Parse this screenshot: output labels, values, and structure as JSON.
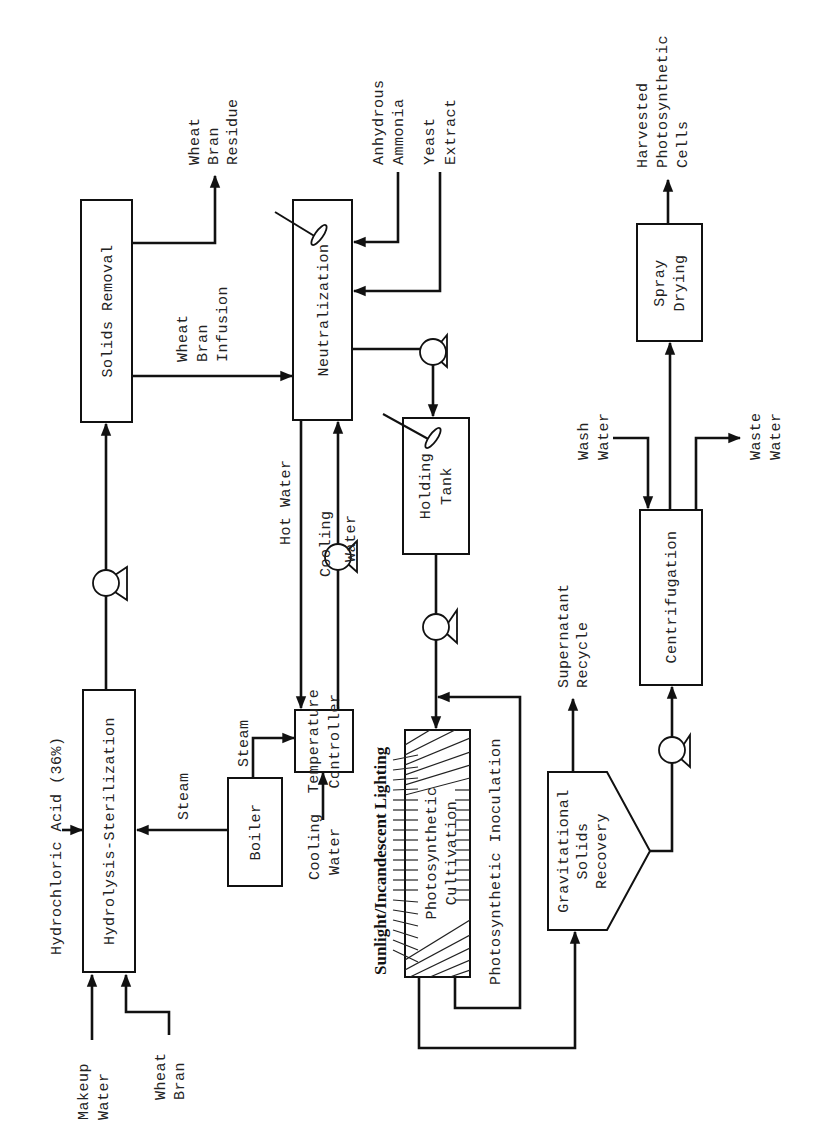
{
  "diagram": {
    "type": "process-flow",
    "orientation": "rotated-90-ccw",
    "units": {
      "solids_removal": "Solids Removal",
      "neutralization": "Neutralization",
      "hydrolysis_sterilization": "Hydrolysis-Sterilization",
      "boiler": "Boiler",
      "temperature_controller": [
        "Temperature",
        "Controller"
      ],
      "holding_tank": [
        "Holding",
        "Tank"
      ],
      "photosynthetic_cultivation": [
        "Photosynthetic",
        "Cultivation"
      ],
      "gravitational_solids_recovery": [
        "Gravitational",
        "Solids",
        "Recovery"
      ],
      "centrifugation": "Centrifugation",
      "spray_drying": [
        "Spray",
        "Drying"
      ]
    },
    "streams": {
      "makeup_water": [
        "Makeup",
        "Water"
      ],
      "wheat_bran": [
        "Wheat",
        "Bran"
      ],
      "hydrochloric_acid": "Hydrochloric Acid (36%)",
      "steam_to_hydrolysis": "Steam",
      "steam_to_controller": "Steam",
      "cooling_water_in": [
        "Cooling",
        "Water"
      ],
      "hot_water": "Hot Water",
      "cooling_water_loop": [
        "Cooling",
        "Water"
      ],
      "wheat_bran_residue": [
        "Wheat",
        "Bran",
        "Residue"
      ],
      "wheat_bran_infusion": [
        "Wheat",
        "Bran",
        "Infusion"
      ],
      "anhydrous_ammonia": [
        "Anhydrous",
        "Ammonia"
      ],
      "yeast_extract": [
        "Yeast",
        "Extract"
      ],
      "lighting": "Sunlight/Incandescent Lighting",
      "photosynthetic_inoculation": "Photosynthetic Inoculation",
      "supernatant_recycle": [
        "Supernatant",
        "Recycle"
      ],
      "wash_water": [
        "Wash",
        "Water"
      ],
      "waste_water": [
        "Waste",
        "Water"
      ],
      "harvested_cells": [
        "Harvested",
        "Photosynthetic",
        "Cells"
      ]
    },
    "symbols": {
      "pump": "pump-icon",
      "agitator": "agitator-icon"
    },
    "colors": {
      "ink": "#111111",
      "background": "#ffffff"
    }
  }
}
